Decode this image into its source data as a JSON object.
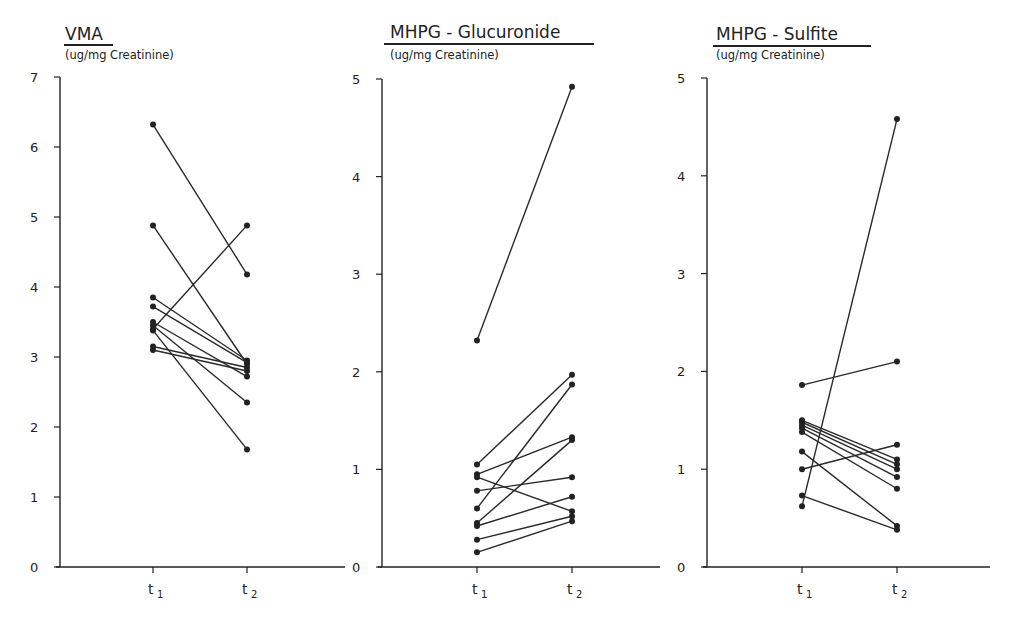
{
  "chart_data": [
    {
      "type": "line",
      "title": "VMA",
      "ylabel": "(ug/mg Creatinine)",
      "categories": [
        "t1",
        "t2"
      ],
      "ylim": [
        0,
        7
      ],
      "yticks": [
        0,
        1,
        2,
        3,
        4,
        5,
        6,
        7
      ],
      "grid": false,
      "series": [
        {
          "name": "subject-1",
          "values": [
            6.32,
            4.18
          ]
        },
        {
          "name": "subject-2",
          "values": [
            4.88,
            2.9
          ]
        },
        {
          "name": "subject-3",
          "values": [
            3.4,
            4.88
          ]
        },
        {
          "name": "subject-4",
          "values": [
            3.85,
            2.95
          ]
        },
        {
          "name": "subject-5",
          "values": [
            3.72,
            2.92
          ]
        },
        {
          "name": "subject-6",
          "values": [
            3.5,
            2.72
          ]
        },
        {
          "name": "subject-7",
          "values": [
            3.45,
            2.35
          ]
        },
        {
          "name": "subject-8",
          "values": [
            3.38,
            1.68
          ]
        },
        {
          "name": "subject-9",
          "values": [
            3.15,
            2.85
          ]
        },
        {
          "name": "subject-10",
          "values": [
            3.1,
            2.8
          ]
        }
      ]
    },
    {
      "type": "line",
      "title": "MHPG - Glucuronide",
      "ylabel": "(ug/mg Creatinine)",
      "categories": [
        "t1",
        "t2"
      ],
      "ylim": [
        0,
        5
      ],
      "yticks": [
        0,
        1,
        2,
        3,
        4,
        5
      ],
      "grid": false,
      "series": [
        {
          "name": "subject-1",
          "values": [
            2.32,
            4.92
          ]
        },
        {
          "name": "subject-2",
          "values": [
            1.05,
            1.97
          ]
        },
        {
          "name": "subject-3",
          "values": [
            0.95,
            1.33
          ]
        },
        {
          "name": "subject-4",
          "values": [
            0.92,
            0.57
          ]
        },
        {
          "name": "subject-5",
          "values": [
            0.78,
            0.92
          ]
        },
        {
          "name": "subject-6",
          "values": [
            0.6,
            1.87
          ]
        },
        {
          "name": "subject-7",
          "values": [
            0.45,
            1.3
          ]
        },
        {
          "name": "subject-8",
          "values": [
            0.42,
            0.72
          ]
        },
        {
          "name": "subject-9",
          "values": [
            0.28,
            0.52
          ]
        },
        {
          "name": "subject-10",
          "values": [
            0.15,
            0.47
          ]
        }
      ]
    },
    {
      "type": "line",
      "title": "MHPG - Sulfite",
      "ylabel": "(ug/mg Creatinine)",
      "categories": [
        "t1",
        "t2"
      ],
      "ylim": [
        0,
        5
      ],
      "yticks": [
        0,
        1,
        2,
        3,
        4,
        5
      ],
      "grid": false,
      "series": [
        {
          "name": "subject-1",
          "values": [
            1.86,
            2.1
          ]
        },
        {
          "name": "subject-2",
          "values": [
            1.5,
            1.1
          ]
        },
        {
          "name": "subject-3",
          "values": [
            1.48,
            1.05
          ]
        },
        {
          "name": "subject-4",
          "values": [
            1.45,
            1.0
          ]
        },
        {
          "name": "subject-5",
          "values": [
            1.42,
            0.92
          ]
        },
        {
          "name": "subject-6",
          "values": [
            1.38,
            0.8
          ]
        },
        {
          "name": "subject-7",
          "values": [
            1.18,
            0.42
          ]
        },
        {
          "name": "subject-8",
          "values": [
            1.0,
            1.25
          ]
        },
        {
          "name": "subject-9",
          "values": [
            0.73,
            0.38
          ]
        },
        {
          "name": "subject-10",
          "values": [
            0.62,
            4.58
          ]
        }
      ]
    }
  ],
  "panels": [
    {
      "title": "VMA",
      "unit": "(ug/mg Creatinine)",
      "x_labels": [
        "t",
        "t"
      ],
      "x_subs": [
        "1",
        "2"
      ]
    },
    {
      "title": "MHPG - Glucuronide",
      "unit": "(ug/mg Creatinine)",
      "x_labels": [
        "t",
        "t"
      ],
      "x_subs": [
        "1",
        "2"
      ]
    },
    {
      "title": "MHPG - Sulfite",
      "unit": "(ug/mg Creatinine)",
      "x_labels": [
        "t",
        "t"
      ],
      "x_subs": [
        "1",
        "2"
      ]
    }
  ],
  "colors": {
    "ink": "#222222",
    "background": "#ffffff"
  }
}
